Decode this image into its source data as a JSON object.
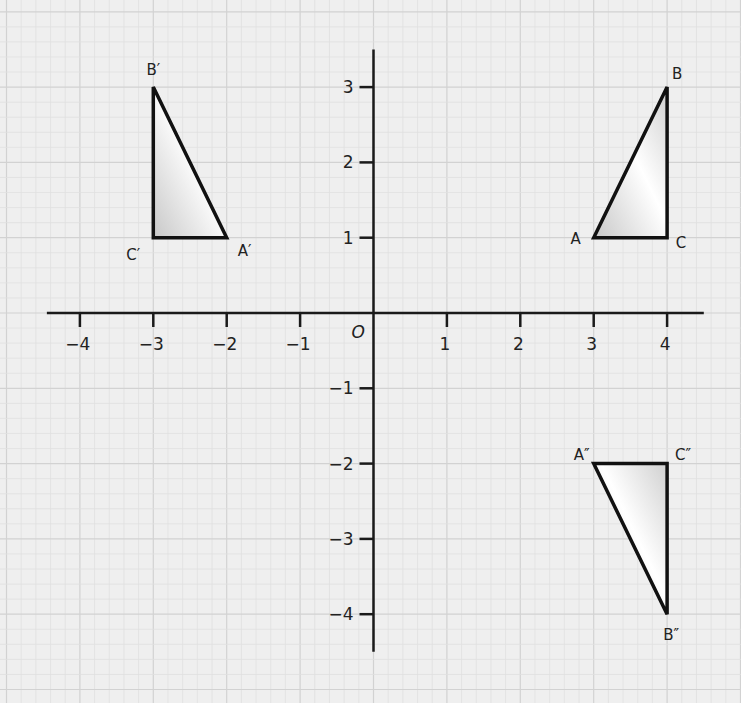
{
  "diagram": {
    "type": "coordinate-plane",
    "colors": {
      "background": "#efefef",
      "grid_minor": "#e0e0e0",
      "grid_major": "#d2d2d2",
      "axis": "#1a1a1a",
      "triangle_stroke": "#111111",
      "triangle_fill_light": "#ffffff",
      "triangle_fill_dark": "#c8c8c8"
    },
    "axes": {
      "origin_label": "O",
      "x_ticks": [
        {
          "value": -4,
          "label": "−4"
        },
        {
          "value": -3,
          "label": "−3"
        },
        {
          "value": -2,
          "label": "−2"
        },
        {
          "value": -1,
          "label": "−1"
        },
        {
          "value": 1,
          "label": "1"
        },
        {
          "value": 2,
          "label": "2"
        },
        {
          "value": 3,
          "label": "3"
        },
        {
          "value": 4,
          "label": "4"
        }
      ],
      "y_ticks": [
        {
          "value": 3,
          "label": "3"
        },
        {
          "value": 2,
          "label": "2"
        },
        {
          "value": 1,
          "label": "1"
        },
        {
          "value": -1,
          "label": "−1"
        },
        {
          "value": -2,
          "label": "−2"
        },
        {
          "value": -3,
          "label": "−3"
        },
        {
          "value": -4,
          "label": "−4"
        }
      ],
      "x_range": [
        -4.45,
        4.5
      ],
      "y_range": [
        -4.5,
        3.5
      ]
    },
    "triangles": [
      {
        "name": "ABC",
        "vertices": [
          {
            "label": "A",
            "x": 3,
            "y": 1
          },
          {
            "label": "B",
            "x": 4,
            "y": 3
          },
          {
            "label": "C",
            "x": 4,
            "y": 1
          }
        ]
      },
      {
        "name": "A′B′C′",
        "vertices": [
          {
            "label": "A′",
            "x": -2,
            "y": 1
          },
          {
            "label": "B′",
            "x": -3,
            "y": 3
          },
          {
            "label": "C′",
            "x": -3,
            "y": 1
          }
        ]
      },
      {
        "name": "A″B″C″",
        "vertices": [
          {
            "label": "A″",
            "x": 3,
            "y": -2
          },
          {
            "label": "B″",
            "x": 4,
            "y": -4
          },
          {
            "label": "C″",
            "x": 4,
            "y": -2
          }
        ]
      }
    ]
  }
}
